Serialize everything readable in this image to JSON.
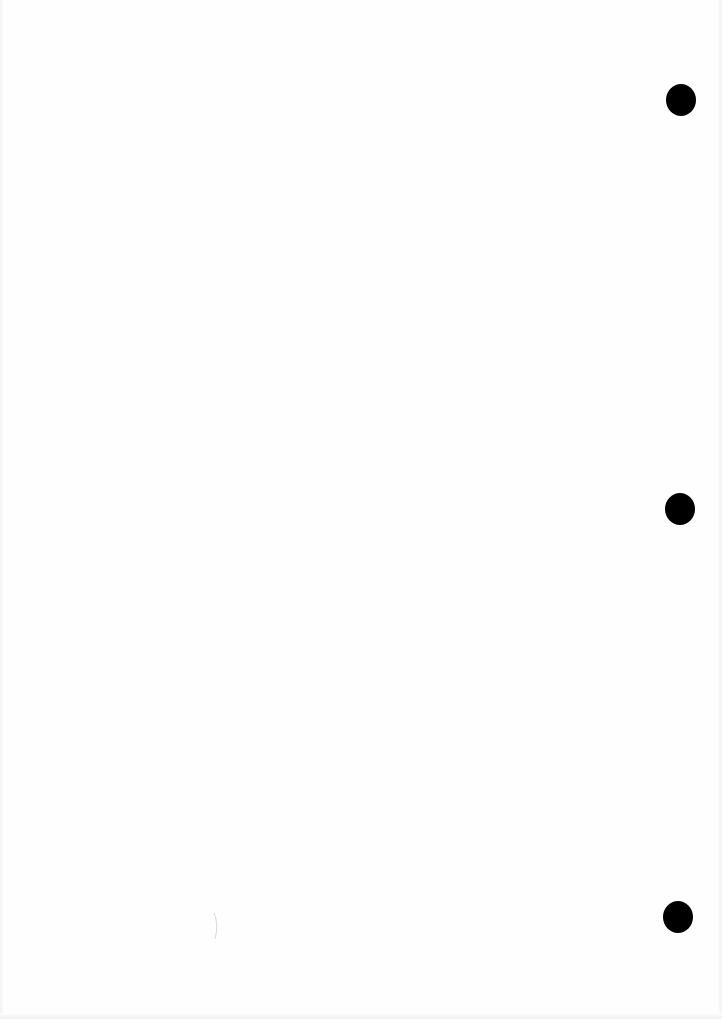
{
  "document": {
    "type": "blank scanned page",
    "text": "",
    "background_color": "#fefefe",
    "punch_holes": {
      "count": 3,
      "color": "#000000",
      "positions": [
        {
          "cx": 681,
          "cy": 100
        },
        {
          "cx": 680,
          "cy": 509
        },
        {
          "cx": 678,
          "cy": 917
        }
      ]
    }
  }
}
